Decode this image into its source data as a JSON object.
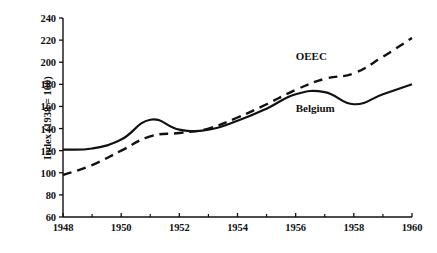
{
  "chart_data": {
    "type": "line",
    "title": "",
    "xlabel": "",
    "ylabel": "Index (1938 = 100)",
    "x": [
      1948,
      1949,
      1950,
      1951,
      1952,
      1953,
      1954,
      1955,
      1956,
      1957,
      1958,
      1959,
      1960
    ],
    "xlim": [
      1948,
      1960
    ],
    "ylim": [
      60,
      240
    ],
    "grid": false,
    "legend_position": "inline-annotations",
    "y_ticks": [
      60,
      80,
      100,
      120,
      140,
      160,
      180,
      200,
      220,
      240
    ],
    "y_tick_labels": [
      "60",
      "80",
      "100",
      "120",
      "140",
      "160",
      "180",
      "200",
      "220",
      "240"
    ],
    "x_ticks": [
      1948,
      1950,
      1952,
      1954,
      1956,
      1958,
      1960
    ],
    "x_tick_labels": [
      "1948",
      "1950",
      "1952",
      "1954",
      "1956",
      "1958",
      "1960"
    ],
    "x_minor_ticks": [
      1949,
      1951,
      1953,
      1955,
      1957,
      1959
    ],
    "series": [
      {
        "name": "OEEC",
        "style": "dashed",
        "color": "#111111",
        "label_x": 1956.0,
        "label_y": 205,
        "values": [
          98,
          107,
          120,
          133,
          136,
          140,
          150,
          162,
          175,
          185,
          190,
          205,
          222
        ]
      },
      {
        "name": "Belgium",
        "style": "solid",
        "color": "#111111",
        "label_x": 1956.0,
        "label_y": 158,
        "values": [
          121,
          122,
          130,
          148,
          139,
          139,
          147,
          158,
          171,
          173,
          162,
          171,
          180
        ]
      }
    ]
  },
  "axes": {
    "y_axis_title": "Index (1938 = 100)"
  }
}
